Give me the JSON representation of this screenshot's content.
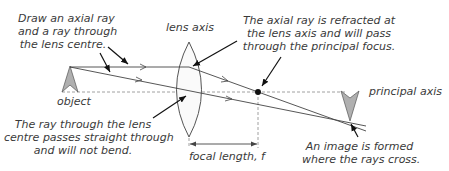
{
  "diagram": {
    "colors": {
      "line": "#444444",
      "dashed": "#888888",
      "arrow_fill": "#b0b0b0",
      "text": "#3a3a3a",
      "focus_dot": "#111111"
    },
    "labels": {
      "draw_rays": [
        "Draw an axial ray",
        "and a ray through",
        "the lens centre."
      ],
      "lens_axis": "lens axis",
      "refracted": [
        "The axial ray is refracted at",
        "the lens axis and will pass",
        "through the principal focus."
      ],
      "object": "object",
      "principal_axis": "principal axis",
      "centre_ray": [
        "The ray through the lens",
        "centre passes straight through",
        "and will not bend."
      ],
      "focal_length": "focal length, f",
      "image_formed": [
        "An image is formed",
        "where the rays cross."
      ]
    },
    "elements": {
      "object_arrow": {
        "x": 70,
        "base_y": 92,
        "tip_y": 67,
        "orientation": "upright"
      },
      "lens": {
        "center_x": 189,
        "top_y": 42,
        "bottom_y": 137,
        "half_width": 15,
        "type": "converging (biconvex)"
      },
      "principal_axis_y": 92,
      "focal_point": {
        "x": 258,
        "y": 92
      },
      "image_arrow": {
        "x": 350,
        "base_y": 91,
        "tip_y": 121,
        "orientation": "inverted"
      },
      "focal_length_dimension": {
        "from_x": 189,
        "to_x": 258,
        "y": 144
      }
    }
  }
}
